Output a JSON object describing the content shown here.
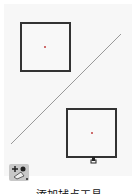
{
  "canvas": {
    "shapes": [
      {
        "type": "square",
        "name": "square-top-left"
      },
      {
        "type": "square",
        "name": "square-bottom-right"
      },
      {
        "type": "line",
        "name": "diagonal-line"
      }
    ],
    "cursor_label": "Q+"
  },
  "toolbar": {
    "tool_icon": "add-snap-point-tool-icon"
  },
  "caption": "添加捕点工具"
}
